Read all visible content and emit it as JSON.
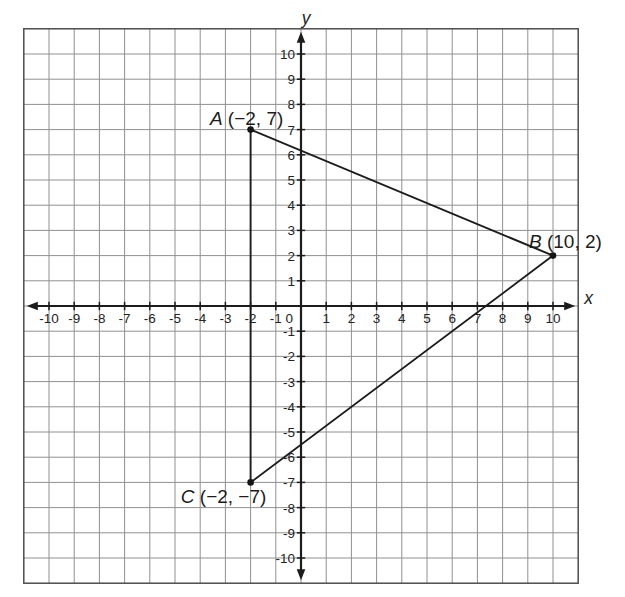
{
  "figure": {
    "background": "#ffffff"
  },
  "chart_data": {
    "type": "scatter",
    "title": "",
    "xlabel": "x",
    "ylabel": "y",
    "xlim": [
      -11,
      11
    ],
    "ylim": [
      -11,
      11
    ],
    "tick_range": [
      -10,
      10
    ],
    "grid": true,
    "legend": false,
    "origin_label": "0",
    "x_tick_labels": [
      "-10",
      "-9",
      "-8",
      "-7",
      "-6",
      "-5",
      "-4",
      "-3",
      "-2",
      "-1",
      "1",
      "2",
      "3",
      "4",
      "5",
      "6",
      "7",
      "8",
      "9",
      "10"
    ],
    "y_tick_labels": [
      "10",
      "9",
      "8",
      "7",
      "6",
      "5",
      "4",
      "3",
      "2",
      "1",
      "-1",
      "-2",
      "-3",
      "-4",
      "-5",
      "-6",
      "-7",
      "-8",
      "-9",
      "-10"
    ],
    "points": [
      {
        "name": "A",
        "x": -2,
        "y": 7,
        "letter": "A",
        "coords_text": "(−2, 7)",
        "label_position": "above"
      },
      {
        "name": "B",
        "x": 10,
        "y": 2,
        "letter": "B",
        "coords_text": "(10, 2)",
        "label_position": "above-right"
      },
      {
        "name": "C",
        "x": -2,
        "y": -7,
        "letter": "C",
        "coords_text": "(−2, −7)",
        "label_position": "below-left"
      }
    ],
    "shape": {
      "type": "triangle",
      "vertices": [
        "A",
        "B",
        "C"
      ],
      "closed": true
    },
    "colors": {
      "grid": "#909090",
      "border": "#4d4d4d",
      "axis": "#1c1c1c",
      "shape": "#1c1c1c",
      "point": "#141414",
      "text": "#242424"
    }
  }
}
